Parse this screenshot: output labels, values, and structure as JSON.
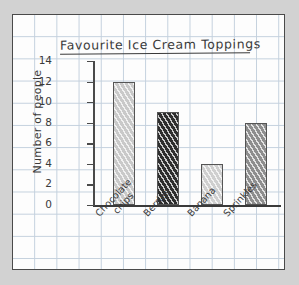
{
  "chart_data": {
    "type": "bar",
    "title": "Favourite Ice Cream Toppings",
    "xlabel": "",
    "ylabel": "Number of people",
    "categories": [
      "Chocolate chips",
      "Berries",
      "Banana",
      "Sprinkles"
    ],
    "values": [
      12,
      9,
      4,
      8
    ],
    "ylim": [
      0,
      14
    ],
    "yticks": [
      0,
      2,
      4,
      6,
      8,
      10,
      12,
      14
    ],
    "grid": true,
    "legend": "none",
    "style": "hand-drawn graph paper",
    "bar_colors": [
      "#c9c9c9",
      "#2e2e2e",
      "#cfcfcf",
      "#8e8e8e"
    ]
  },
  "labels": {
    "cat0_line1": "Chocolate",
    "cat0_line2": "chips",
    "cat1": "Berries",
    "cat2": "Banana",
    "cat3": "Sprinkles",
    "y0": "0",
    "y2": "2",
    "y4": "4",
    "y6": "6",
    "y8": "8",
    "y10": "10",
    "y12": "12",
    "y14": "14"
  }
}
